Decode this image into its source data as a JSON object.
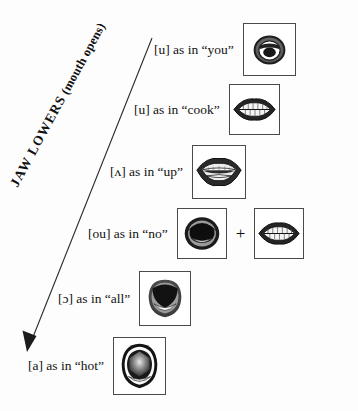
{
  "figure": {
    "background_color": "#fdfdfd",
    "ink_color": "#111111"
  },
  "arrow": {
    "name": "jaw-lowers-arrow",
    "caption_full": "JAW LOWERS (mouth opens)",
    "caption_primary": "JAW LOWERS",
    "caption_secondary": "(mouth opens)",
    "caption_parts": {
      "j": "J",
      "aw_small": "AW",
      "space": " ",
      "l": "L",
      "owers_small": "OWERS"
    },
    "direction": "downward-left",
    "start": {
      "x": 152,
      "y": 38
    },
    "end": {
      "x": 27,
      "y": 352
    },
    "color": "#2a2a2a"
  },
  "rows": [
    {
      "id": "row-u-you",
      "label": "[u] as in “you”",
      "symbol": "u",
      "example_word": "you",
      "mouth": {
        "name": "mouth-rounded-small",
        "description": "tightly rounded puckered lips with small dark opening",
        "openness": 1
      },
      "extra_mouth": null,
      "plus": null
    },
    {
      "id": "row-u-cook",
      "label": "[u] as in “cook”",
      "symbol": "u",
      "example_word": "cook",
      "mouth": {
        "name": "mouth-teeth-closed",
        "description": "lips parted showing upper and lower teeth rows",
        "openness": 2
      },
      "extra_mouth": null,
      "plus": null
    },
    {
      "id": "row-wedge-up",
      "label": "[ʌ] as in “up”",
      "symbol": "ʌ",
      "example_word": "up",
      "mouth": {
        "name": "mouth-teeth-open",
        "description": "wider parted lips with teeth and dark gap",
        "openness": 3
      },
      "extra_mouth": null,
      "plus": null
    },
    {
      "id": "row-ou-no",
      "label": "[ou] as in “no”",
      "symbol": "ou",
      "example_word": "no",
      "mouth": {
        "name": "mouth-open-dark",
        "description": "open mouth with large dark cavity and lower teeth",
        "openness": 4
      },
      "extra_mouth": {
        "name": "mouth-teeth-closed-secondary",
        "description": "second glide position, lips with teeth showing",
        "openness": 2
      },
      "plus": "+"
    },
    {
      "id": "row-openo-all",
      "label": "[ɔ] as in “all”",
      "symbol": "ɔ",
      "example_word": "all",
      "mouth": {
        "name": "mouth-wide-oval",
        "description": "wide open dark oval mouth, jaw dropped",
        "openness": 5
      },
      "extra_mouth": null,
      "plus": null
    },
    {
      "id": "row-a-hot",
      "label": "[a] as in “hot”",
      "symbol": "a",
      "example_word": "hot",
      "mouth": {
        "name": "mouth-widest-open",
        "description": "widest open mouth, maximum jaw lowering",
        "openness": 6
      },
      "extra_mouth": null,
      "plus": null
    }
  ]
}
